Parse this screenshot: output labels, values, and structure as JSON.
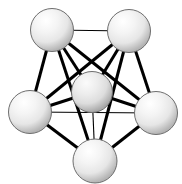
{
  "figure": {
    "background_color": "#ffffff",
    "width": 182,
    "height": 184
  },
  "style": {
    "edge_color": "#000000",
    "edge_width_thin": 1.1,
    "edge_width_thick": 3.0,
    "node_outline_color": "#6e6e6e",
    "node_highlight_color": "#ffffff",
    "node_mid_color": "#ededed",
    "node_shadow_color": "#a8a8a8",
    "node_radius": 21.5
  },
  "graph": {
    "node_count": 6,
    "edge_count": 15,
    "nodes": [
      {
        "id": "n1",
        "label": "top-left",
        "cx": 52,
        "cy": 30,
        "r": 21.5
      },
      {
        "id": "n2",
        "label": "top-right",
        "cx": 129,
        "cy": 31,
        "r": 21.5
      },
      {
        "id": "n3",
        "label": "left",
        "cx": 30,
        "cy": 112,
        "r": 21.5
      },
      {
        "id": "n4",
        "label": "center",
        "cx": 92,
        "cy": 92,
        "r": 20.5
      },
      {
        "id": "n5",
        "label": "right",
        "cx": 156,
        "cy": 113,
        "r": 21.5
      },
      {
        "id": "n6",
        "label": "bottom",
        "cx": 95,
        "cy": 161,
        "r": 22.0
      }
    ],
    "edges": [
      {
        "from": "n1",
        "to": "n2",
        "x1": 52,
        "y1": 30,
        "x2": 129,
        "y2": 31,
        "weight": "thin"
      },
      {
        "from": "n1",
        "to": "n3",
        "x1": 52,
        "y1": 30,
        "x2": 30,
        "y2": 112,
        "weight": "thick"
      },
      {
        "from": "n1",
        "to": "n4",
        "x1": 52,
        "y1": 30,
        "x2": 92,
        "y2": 92,
        "weight": "thick"
      },
      {
        "from": "n1",
        "to": "n5",
        "x1": 52,
        "y1": 30,
        "x2": 156,
        "y2": 113,
        "weight": "thick"
      },
      {
        "from": "n1",
        "to": "n6",
        "x1": 52,
        "y1": 30,
        "x2": 95,
        "y2": 161,
        "weight": "thick"
      },
      {
        "from": "n2",
        "to": "n3",
        "x1": 129,
        "y1": 31,
        "x2": 30,
        "y2": 112,
        "weight": "thick"
      },
      {
        "from": "n2",
        "to": "n4",
        "x1": 129,
        "y1": 31,
        "x2": 92,
        "y2": 92,
        "weight": "thick"
      },
      {
        "from": "n2",
        "to": "n5",
        "x1": 129,
        "y1": 31,
        "x2": 156,
        "y2": 113,
        "weight": "thick"
      },
      {
        "from": "n2",
        "to": "n6",
        "x1": 129,
        "y1": 31,
        "x2": 95,
        "y2": 161,
        "weight": "thick"
      },
      {
        "from": "n3",
        "to": "n4",
        "x1": 30,
        "y1": 112,
        "x2": 92,
        "y2": 92,
        "weight": "thick"
      },
      {
        "from": "n3",
        "to": "n5",
        "x1": 30,
        "y1": 112,
        "x2": 156,
        "y2": 113,
        "weight": "thin"
      },
      {
        "from": "n3",
        "to": "n6",
        "x1": 30,
        "y1": 112,
        "x2": 95,
        "y2": 161,
        "weight": "thick"
      },
      {
        "from": "n4",
        "to": "n5",
        "x1": 92,
        "y1": 92,
        "x2": 156,
        "y2": 113,
        "weight": "thick"
      },
      {
        "from": "n4",
        "to": "n6",
        "x1": 92,
        "y1": 92,
        "x2": 95,
        "y2": 161,
        "weight": "thin"
      },
      {
        "from": "n5",
        "to": "n6",
        "x1": 156,
        "y1": 113,
        "x2": 95,
        "y2": 161,
        "weight": "thick"
      }
    ]
  }
}
